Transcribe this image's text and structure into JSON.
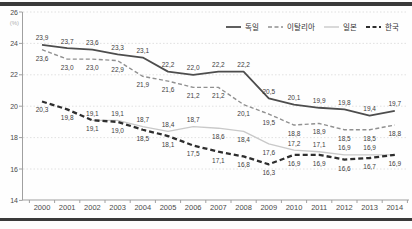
{
  "figure": {
    "rule_color": "#3a3a3a",
    "background": "#fefefe"
  },
  "chart_data": {
    "type": "line",
    "title": "",
    "unit_label": "(%)",
    "categories": [
      "2000",
      "2001",
      "2002",
      "2003",
      "2004",
      "2005",
      "2006",
      "2007",
      "2008",
      "2009",
      "2010",
      "2011",
      "2012",
      "2013",
      "2014"
    ],
    "ylim": [
      14,
      26
    ],
    "yticks": [
      26,
      24,
      22,
      20,
      18,
      16,
      14
    ],
    "grid": "horizontal-dotted",
    "legend_position": "top-right",
    "decimal_separator": ",",
    "colors": {
      "grid": "#d9d9d9",
      "axis": "#a0a0a0",
      "tick_text": "#4a4a4a",
      "data_label": "#3d3d3d",
      "unit_text": "#b0b0b0"
    },
    "series": [
      {
        "name": "독일",
        "values": [
          23.9,
          23.7,
          23.6,
          23.3,
          23.1,
          22.2,
          22.0,
          22.2,
          22.2,
          20.5,
          20.1,
          19.9,
          19.8,
          19.4,
          19.7
        ],
        "color": "#4d4d4d",
        "dash": "",
        "stroke_width": 1.8,
        "label_sides": [
          "above",
          "above",
          "above",
          "above",
          "above",
          "above",
          "above",
          "above",
          "above",
          "above",
          "above",
          "above",
          "above",
          "above",
          "above"
        ]
      },
      {
        "name": "이탈리아",
        "values": [
          23.6,
          23.0,
          23.0,
          22.9,
          21.9,
          21.6,
          21.2,
          21.2,
          20.1,
          19.5,
          18.8,
          18.9,
          18.5,
          18.5,
          18.8
        ],
        "color": "#909090",
        "dash": "4,2.5",
        "stroke_width": 1.4,
        "label_sides": [
          "below",
          "below",
          "below",
          "below",
          "below",
          "below",
          "below",
          "below",
          "below",
          "below",
          "below",
          "below",
          "below",
          "below",
          "below"
        ]
      },
      {
        "name": "일본",
        "values": [
          null,
          null,
          19.1,
          19.1,
          18.7,
          18.4,
          18.7,
          18.6,
          18.4,
          17.6,
          17.2,
          17.1,
          16.9,
          16.9,
          16.9
        ],
        "color": "#c9c9c9",
        "dash": "",
        "stroke_width": 1.4,
        "label_sides": [
          "none",
          "none",
          "above",
          "above",
          "above",
          "above",
          "above",
          "below",
          "below",
          "below",
          "above",
          "above",
          "above",
          "above",
          "none"
        ]
      },
      {
        "name": "한국",
        "values": [
          20.3,
          19.8,
          19.1,
          19.0,
          18.5,
          18.1,
          17.5,
          17.1,
          16.8,
          16.3,
          16.9,
          16.9,
          16.6,
          16.7,
          16.9
        ],
        "color": "#2e2e2e",
        "dash": "5,3",
        "stroke_width": 2.3,
        "label_sides": [
          "below",
          "below",
          "below",
          "below",
          "below",
          "below",
          "below",
          "below",
          "below",
          "below",
          "below",
          "below",
          "below",
          "below",
          "below"
        ]
      }
    ]
  }
}
